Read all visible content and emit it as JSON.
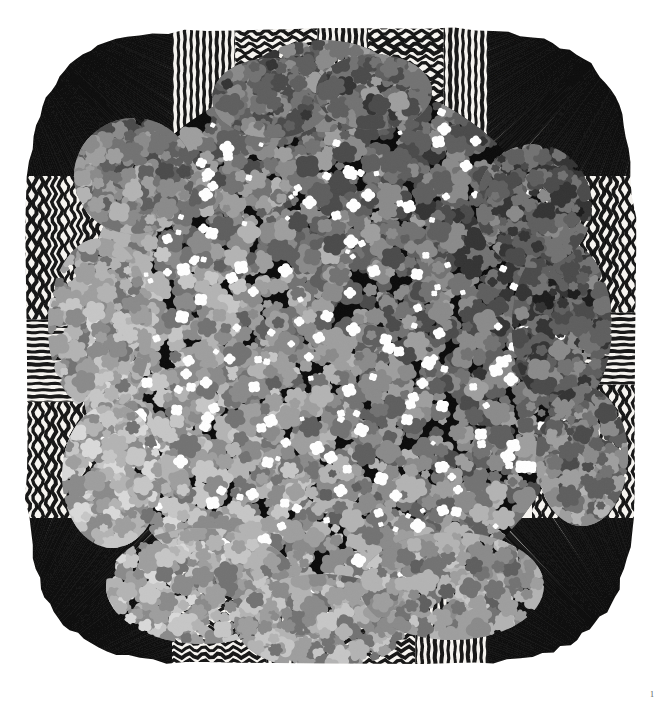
{
  "page": {
    "width": 665,
    "height": 704,
    "background_color": "#ffffff",
    "page_number": "1"
  },
  "artwork": {
    "title": "Striped-border textile with dense floral cluster",
    "medium_appearance": "grayscale scanned cloth / textile artwork",
    "x": 22,
    "y": 26,
    "width": 616,
    "height": 642,
    "cloth_edge_color": "#1a1a1a",
    "cloth_ground_color": "#f4f2ee",
    "border": {
      "description": "Black and white stripe bands framing the cloth; corners are diagonal radiating fans, edges alternate vertical straight stripes and horizontal wavy stripes",
      "stripe_dark": "#121212",
      "stripe_light": "#f7f5f1",
      "stripe_period_px": 7,
      "panels": [
        {
          "id": "corner-top-left",
          "pattern": "diagonal-fan",
          "angle_deg": 38
        },
        {
          "id": "top-band-1",
          "pattern": "vertical-stripes",
          "angle_deg": 0
        },
        {
          "id": "top-band-2",
          "pattern": "horizontal-wavy",
          "angle_deg": 0
        },
        {
          "id": "top-band-3",
          "pattern": "vertical-stripes",
          "angle_deg": 0
        },
        {
          "id": "top-band-4",
          "pattern": "horizontal-wavy",
          "angle_deg": 0
        },
        {
          "id": "corner-top-right",
          "pattern": "diagonal-fan",
          "angle_deg": -38
        },
        {
          "id": "left-band-1",
          "pattern": "vertical-wavy",
          "angle_deg": 0
        },
        {
          "id": "left-band-2",
          "pattern": "horizontal-stripes",
          "angle_deg": 0
        },
        {
          "id": "left-band-3",
          "pattern": "vertical-wavy",
          "angle_deg": 0
        },
        {
          "id": "right-band-1",
          "pattern": "vertical-wavy",
          "angle_deg": 0
        },
        {
          "id": "right-band-2",
          "pattern": "horizontal-stripes",
          "angle_deg": 0
        },
        {
          "id": "right-band-3",
          "pattern": "vertical-wavy",
          "angle_deg": 0
        },
        {
          "id": "corner-bottom-left",
          "pattern": "diagonal-fan",
          "angle_deg": -38
        },
        {
          "id": "bottom-band-1",
          "pattern": "horizontal-wavy",
          "angle_deg": 0
        },
        {
          "id": "bottom-band-2",
          "pattern": "vertical-stripes",
          "angle_deg": 0
        },
        {
          "id": "bottom-band-3",
          "pattern": "horizontal-wavy",
          "angle_deg": 0
        },
        {
          "id": "corner-bottom-right",
          "pattern": "diagonal-fan",
          "angle_deg": 38
        }
      ]
    },
    "center_cluster": {
      "description": "Dense pointillist mass of overlapping rounded flower-like blobs occupying the central roundish field, bulging past the border on the top and bottom",
      "center_x": 308,
      "center_y": 318,
      "radius_x": 252,
      "radius_y": 268,
      "blob_count": 2600,
      "blob_min_radius": 4,
      "blob_max_radius": 13,
      "tone_palette": [
        "#050505",
        "#1b1b1b",
        "#333333",
        "#4a4a4a",
        "#5e5e5e",
        "#727272",
        "#8a8a8a",
        "#9e9e9e",
        "#b3b3b3",
        "#c6c6c6",
        "#d9d9d9",
        "#ececec",
        "#ffffff"
      ],
      "tonal_regions": [
        {
          "id": "upper-left-dark",
          "cx": 0.3,
          "cy": 0.16,
          "bias": -0.3,
          "label": "dark upper-left arc"
        },
        {
          "id": "upper-right-mid",
          "cx": 0.72,
          "cy": 0.14,
          "bias": -0.1,
          "label": "mid-tone upper-right"
        },
        {
          "id": "center-light",
          "cx": 0.38,
          "cy": 0.42,
          "bias": 0.34,
          "label": "pale light center-left swirl"
        },
        {
          "id": "right-black",
          "cx": 0.82,
          "cy": 0.44,
          "bias": -0.46,
          "label": "deep black right flank"
        },
        {
          "id": "lower-center-mid",
          "cx": 0.5,
          "cy": 0.7,
          "bias": -0.08,
          "label": "mid grey lower center"
        },
        {
          "id": "lower-left-light",
          "cx": 0.26,
          "cy": 0.82,
          "bias": 0.36,
          "label": "pale lower-left lobe"
        },
        {
          "id": "lower-right-light",
          "cx": 0.78,
          "cy": 0.86,
          "bias": 0.22,
          "label": "pale lower-right lobe"
        },
        {
          "id": "rim-light",
          "cx": 0.08,
          "cy": 0.52,
          "bias": 0.3,
          "label": "pale left rim"
        }
      ]
    }
  }
}
